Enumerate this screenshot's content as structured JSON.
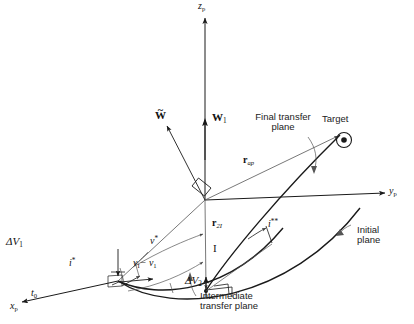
{
  "figure": {
    "kind": "orbital-transfer-geometry-diagram",
    "axes": {
      "z": "z",
      "z_sub": "p",
      "y": "y",
      "y_sub": "p",
      "x": "x",
      "x_sub": "p"
    },
    "origin_label": {
      "sym": "t",
      "sub": "0"
    },
    "vectors": [
      {
        "name": "w-tilde",
        "label": "W",
        "accent": "tilde",
        "sub": ""
      },
      {
        "name": "w-one",
        "label": "W",
        "accent": "none",
        "sub": "1"
      },
      {
        "name": "r-ap",
        "label": "r",
        "accent": "none",
        "sub": "ap"
      },
      {
        "name": "r-2I",
        "label": "r",
        "accent": "none",
        "sub": "2I"
      }
    ],
    "arcs": [
      {
        "name": "v-star",
        "label": "v",
        "sup": "*"
      },
      {
        "name": "v-I-minus-v-1",
        "label": "v",
        "sub": "I",
        "rest": "− v",
        "rest_sub": "1"
      }
    ],
    "deltas": [
      {
        "name": "delta-v1",
        "label": "ΔV",
        "sub": "1"
      },
      {
        "name": "delta-v2",
        "label": "ΔV",
        "sub": "2"
      }
    ],
    "angles": [
      {
        "name": "i-star",
        "label": "i",
        "sup": "*"
      },
      {
        "name": "i-double-star",
        "label": "i",
        "sup": "**"
      }
    ],
    "point_I": "I",
    "callouts": {
      "target": "Target",
      "final_transfer_plane": [
        "Final transfer",
        "plane"
      ],
      "initial_plane": [
        "Initial",
        "plane"
      ],
      "intermediate_transfer_plane": [
        "Intermediate",
        "transfer plane"
      ]
    },
    "colors": {
      "stroke": "#1a1a1a",
      "thin": "#555555",
      "background": "#ffffff"
    }
  }
}
